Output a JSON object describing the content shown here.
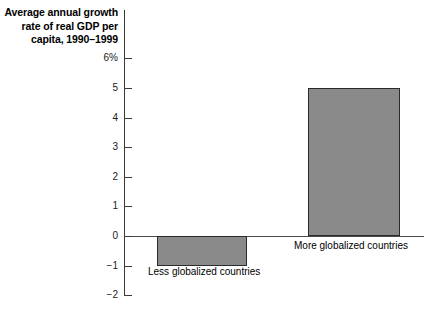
{
  "chart_data": {
    "type": "bar",
    "title": "Average annual growth rate of real GDP per capita, 1990–1999",
    "title_lines": [
      "Average annual growth",
      "rate of real GDP per",
      "capita, 1990–1999"
    ],
    "xlabel": "",
    "ylabel": "Average annual growth rate of real GDP per capita, 1990–1999",
    "categories": [
      "Less globalized countries",
      "More globalized countries"
    ],
    "values": [
      -1,
      5
    ],
    "ylim": [
      -2,
      6
    ],
    "yticks": [
      6,
      5,
      4,
      3,
      2,
      1,
      0,
      -1,
      -2
    ],
    "ytick_labels": [
      "6%",
      "5",
      "4",
      "3",
      "2",
      "1",
      "0",
      "−1",
      "−2"
    ],
    "grid": false,
    "legend": "none",
    "bar_color": "#8a8a8a",
    "bar_edge_color": "#2b2b2b",
    "axis_color": "#3a3a3a",
    "background_color": "#ffffff",
    "unit": "percent"
  },
  "axis": {
    "ticks": [
      {
        "label": "6%",
        "value": 6
      },
      {
        "label": "5",
        "value": 5
      },
      {
        "label": "4",
        "value": 4
      },
      {
        "label": "3",
        "value": 3
      },
      {
        "label": "2",
        "value": 2
      },
      {
        "label": "1",
        "value": 1
      },
      {
        "label": "0",
        "value": 0
      },
      {
        "label": "−1",
        "value": -1
      },
      {
        "label": "−2",
        "value": -2
      }
    ]
  },
  "bars": [
    {
      "label": "Less globalized countries",
      "value": -1
    },
    {
      "label": "More globalized countries",
      "value": 5
    }
  ]
}
